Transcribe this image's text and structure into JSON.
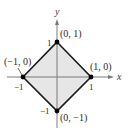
{
  "figure": {
    "type": "coordinate-diagram",
    "axes": {
      "x_label": "x",
      "y_label": "y"
    },
    "ticks": {
      "x_pos": "1",
      "x_neg": "−1",
      "y_pos": "1",
      "y_neg": "−1"
    },
    "vertices": [
      {
        "label": "(0, 1)",
        "x": 0,
        "y": 1
      },
      {
        "label": "(1, 0)",
        "x": 1,
        "y": 0
      },
      {
        "label": "(0, −1)",
        "x": 0,
        "y": -1
      },
      {
        "label": "(−1, 0)",
        "x": -1,
        "y": 0
      }
    ],
    "colors": {
      "fill": "#e6e6e6",
      "edge": "#1a1a1a",
      "axis": "#7a7a7a",
      "point": "#000000"
    }
  }
}
